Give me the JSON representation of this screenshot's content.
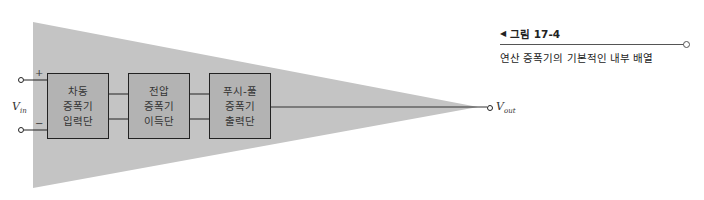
{
  "figure": {
    "number_label": "그림 17-4",
    "description": "연산 증폭기의 기본적인 내부 배열",
    "colors": {
      "triangle_fill": "#c4c4c4",
      "block_fill": "#b3b3b3",
      "line": "#222222"
    }
  },
  "diagram": {
    "input": {
      "label_main": "V",
      "label_sub": "in",
      "plus_symbol": "+",
      "minus_symbol": "−"
    },
    "output": {
      "label_main": "V",
      "label_sub": "out"
    },
    "blocks": [
      {
        "lines": [
          "차동",
          "증폭기",
          "입력단"
        ]
      },
      {
        "lines": [
          "전압",
          "증폭기",
          "이득단"
        ]
      },
      {
        "lines": [
          "푸시-풀",
          "증폭기",
          "출력단"
        ]
      }
    ]
  }
}
